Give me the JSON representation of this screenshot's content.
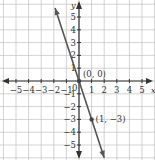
{
  "chart_data": {
    "type": "line",
    "title": "",
    "xlabel": "x",
    "ylabel": "y",
    "xlim": [
      -5.5,
      5.5
    ],
    "ylim": [
      -5.5,
      5.5
    ],
    "grid": true,
    "x_ticks": [
      "-5",
      "-4",
      "-3",
      "-2",
      "-1",
      "0",
      "1",
      "2",
      "3",
      "4",
      "5"
    ],
    "y_ticks": [
      "-5",
      "-4",
      "-3",
      "-2",
      "-1",
      "1",
      "2",
      "3",
      "4",
      "5"
    ],
    "series": [
      {
        "name": "y = -3x",
        "x": [
          -1.9,
          2.0
        ],
        "y": [
          5.7,
          -6.0
        ],
        "color": "#555555"
      }
    ],
    "points": [
      {
        "x": 0,
        "y": 0,
        "label": "(0, 0)"
      },
      {
        "x": 1,
        "y": -3,
        "label": "(1, −3)"
      }
    ],
    "colors": {
      "grid": "#c8c8c8",
      "axis": "#333333",
      "line": "#555555"
    }
  }
}
